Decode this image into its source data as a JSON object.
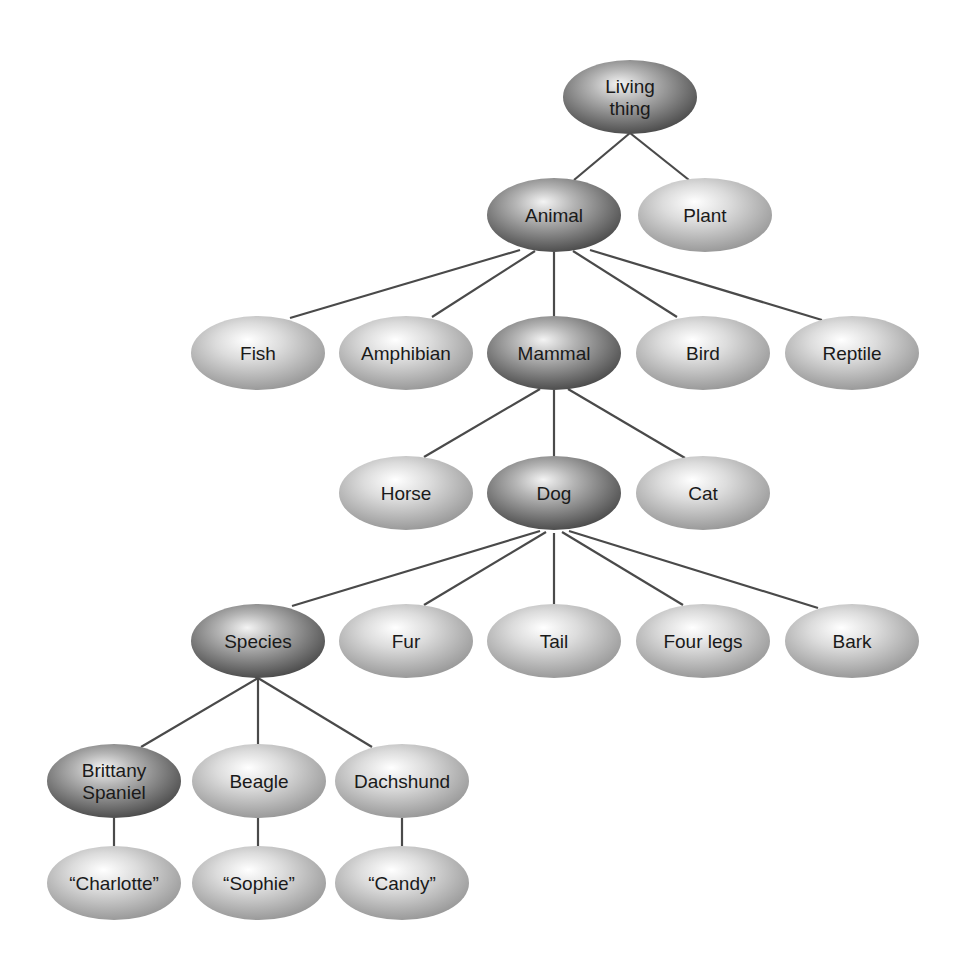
{
  "diagram": {
    "colors": {
      "edge": "#4a4a4a",
      "highlight_light": "#f2f2f2",
      "highlight_dark": "#4e4e4e",
      "leaf_light": "#ffffff",
      "leaf_dark": "#9a9a9a",
      "text": "#1a1a1a"
    },
    "ellipse": {
      "rx": 67,
      "ry": 37
    },
    "nodes": [
      {
        "id": "living-thing",
        "lines": [
          "Living",
          "thing"
        ],
        "x": 630,
        "y": 97,
        "style": "dark"
      },
      {
        "id": "animal",
        "lines": [
          "Animal"
        ],
        "x": 554,
        "y": 215,
        "style": "dark"
      },
      {
        "id": "plant",
        "lines": [
          "Plant"
        ],
        "x": 705,
        "y": 215,
        "style": "light"
      },
      {
        "id": "fish",
        "lines": [
          "Fish"
        ],
        "x": 258,
        "y": 353,
        "style": "light"
      },
      {
        "id": "amphibian",
        "lines": [
          "Amphibian"
        ],
        "x": 406,
        "y": 353,
        "style": "light"
      },
      {
        "id": "mammal",
        "lines": [
          "Mammal"
        ],
        "x": 554,
        "y": 353,
        "style": "dark"
      },
      {
        "id": "bird",
        "lines": [
          "Bird"
        ],
        "x": 703,
        "y": 353,
        "style": "light"
      },
      {
        "id": "reptile",
        "lines": [
          "Reptile"
        ],
        "x": 852,
        "y": 353,
        "style": "light"
      },
      {
        "id": "horse",
        "lines": [
          "Horse"
        ],
        "x": 406,
        "y": 493,
        "style": "light"
      },
      {
        "id": "dog",
        "lines": [
          "Dog"
        ],
        "x": 554,
        "y": 493,
        "style": "dark"
      },
      {
        "id": "cat",
        "lines": [
          "Cat"
        ],
        "x": 703,
        "y": 493,
        "style": "light"
      },
      {
        "id": "species",
        "lines": [
          "Species"
        ],
        "x": 258,
        "y": 641,
        "style": "dark"
      },
      {
        "id": "fur",
        "lines": [
          "Fur"
        ],
        "x": 406,
        "y": 641,
        "style": "light"
      },
      {
        "id": "tail",
        "lines": [
          "Tail"
        ],
        "x": 554,
        "y": 641,
        "style": "light"
      },
      {
        "id": "four-legs",
        "lines": [
          "Four legs"
        ],
        "x": 703,
        "y": 641,
        "style": "light"
      },
      {
        "id": "bark",
        "lines": [
          "Bark"
        ],
        "x": 852,
        "y": 641,
        "style": "light"
      },
      {
        "id": "brittany-spaniel",
        "lines": [
          "Brittany",
          "Spaniel"
        ],
        "x": 114,
        "y": 781,
        "style": "dark"
      },
      {
        "id": "beagle",
        "lines": [
          "Beagle"
        ],
        "x": 259,
        "y": 781,
        "style": "light"
      },
      {
        "id": "dachshund",
        "lines": [
          "Dachshund"
        ],
        "x": 402,
        "y": 781,
        "style": "light"
      },
      {
        "id": "charlotte",
        "lines": [
          "“Charlotte”"
        ],
        "x": 114,
        "y": 883,
        "style": "light"
      },
      {
        "id": "sophie",
        "lines": [
          "“Sophie”"
        ],
        "x": 259,
        "y": 883,
        "style": "light"
      },
      {
        "id": "candy",
        "lines": [
          "“Candy”"
        ],
        "x": 402,
        "y": 883,
        "style": "light"
      }
    ],
    "edges": [
      {
        "from": "living-thing",
        "to": "animal",
        "x1": 630,
        "y1": 133,
        "x2": 574,
        "y2": 180
      },
      {
        "from": "living-thing",
        "to": "plant",
        "x1": 630,
        "y1": 133,
        "x2": 689,
        "y2": 180
      },
      {
        "from": "animal",
        "to": "fish",
        "x1": 520,
        "y1": 250,
        "x2": 290,
        "y2": 318
      },
      {
        "from": "animal",
        "to": "amphibian",
        "x1": 535,
        "y1": 251,
        "x2": 432,
        "y2": 317
      },
      {
        "from": "animal",
        "to": "mammal",
        "x1": 554,
        "y1": 252,
        "x2": 554,
        "y2": 316
      },
      {
        "from": "animal",
        "to": "bird",
        "x1": 573,
        "y1": 251,
        "x2": 677,
        "y2": 317
      },
      {
        "from": "animal",
        "to": "reptile",
        "x1": 590,
        "y1": 250,
        "x2": 822,
        "y2": 320
      },
      {
        "from": "mammal",
        "to": "horse",
        "x1": 540,
        "y1": 389,
        "x2": 424,
        "y2": 457
      },
      {
        "from": "mammal",
        "to": "dog",
        "x1": 554,
        "y1": 390,
        "x2": 554,
        "y2": 456
      },
      {
        "from": "mammal",
        "to": "cat",
        "x1": 568,
        "y1": 389,
        "x2": 685,
        "y2": 458
      },
      {
        "from": "dog",
        "to": "species",
        "x1": 540,
        "y1": 531,
        "x2": 292,
        "y2": 606
      },
      {
        "from": "dog",
        "to": "fur",
        "x1": 546,
        "y1": 532,
        "x2": 424,
        "y2": 605
      },
      {
        "from": "dog",
        "to": "tail",
        "x1": 554,
        "y1": 533,
        "x2": 554,
        "y2": 604
      },
      {
        "from": "dog",
        "to": "four-legs",
        "x1": 562,
        "y1": 532,
        "x2": 683,
        "y2": 605
      },
      {
        "from": "dog",
        "to": "bark",
        "x1": 569,
        "y1": 531,
        "x2": 818,
        "y2": 608
      },
      {
        "from": "species",
        "to": "brittany-spaniel",
        "x1": 258,
        "y1": 678,
        "x2": 141,
        "y2": 747
      },
      {
        "from": "species",
        "to": "beagle",
        "x1": 258,
        "y1": 678,
        "x2": 258,
        "y2": 744
      },
      {
        "from": "species",
        "to": "dachshund",
        "x1": 258,
        "y1": 678,
        "x2": 372,
        "y2": 747
      },
      {
        "from": "brittany-spaniel",
        "to": "charlotte",
        "x1": 114,
        "y1": 818,
        "x2": 114,
        "y2": 846
      },
      {
        "from": "beagle",
        "to": "sophie",
        "x1": 258,
        "y1": 818,
        "x2": 258,
        "y2": 846
      },
      {
        "from": "dachshund",
        "to": "candy",
        "x1": 402,
        "y1": 818,
        "x2": 402,
        "y2": 846
      }
    ]
  }
}
